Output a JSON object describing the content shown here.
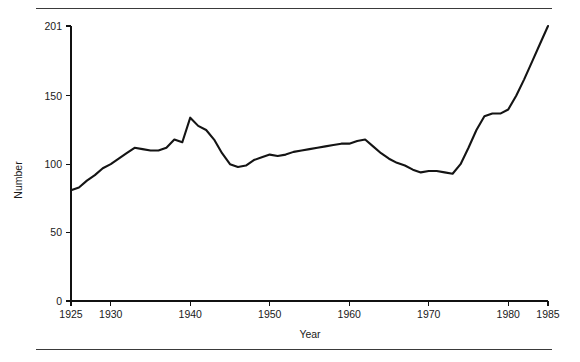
{
  "figure": {
    "background_color": "#ffffff",
    "line_color": "#141414",
    "axis_color": "#111111",
    "rule_color": "#3a3a3a",
    "top_rule": "",
    "bottom_rule": ""
  },
  "chart_data": {
    "type": "line",
    "title": "",
    "xlabel": "Year",
    "ylabel": "Number",
    "xlim": [
      1925,
      1985
    ],
    "ylim": [
      0,
      201
    ],
    "grid": false,
    "legend": null,
    "xticks": [
      1925,
      1930,
      1940,
      1950,
      1960,
      1970,
      1980,
      1985
    ],
    "xtick_labels": [
      "1925",
      "1930",
      "1940",
      "1950",
      "1960",
      "1970",
      "1980",
      "1985"
    ],
    "yticks": [
      0,
      50,
      100,
      150,
      201
    ],
    "ytick_labels": [
      "0",
      "50",
      "100",
      "150",
      "201"
    ],
    "series": [
      {
        "name": "Number",
        "x": [
          1925,
          1926,
          1927,
          1928,
          1929,
          1930,
          1931,
          1932,
          1933,
          1934,
          1935,
          1936,
          1937,
          1938,
          1939,
          1940,
          1941,
          1942,
          1943,
          1944,
          1945,
          1946,
          1947,
          1948,
          1949,
          1950,
          1951,
          1952,
          1953,
          1954,
          1955,
          1956,
          1957,
          1958,
          1959,
          1960,
          1961,
          1962,
          1963,
          1964,
          1965,
          1966,
          1967,
          1968,
          1969,
          1970,
          1971,
          1972,
          1973,
          1974,
          1975,
          1976,
          1977,
          1978,
          1979,
          1980,
          1981,
          1982,
          1983,
          1984,
          1985
        ],
        "y": [
          81,
          83,
          88,
          92,
          97,
          100,
          104,
          108,
          112,
          111,
          110,
          110,
          112,
          118,
          116,
          134,
          128,
          125,
          118,
          108,
          100,
          98,
          99,
          103,
          105,
          107,
          106,
          107,
          109,
          110,
          111,
          112,
          113,
          114,
          115,
          115,
          117,
          118,
          113,
          108,
          104,
          101,
          99,
          96,
          94,
          95,
          95,
          94,
          93,
          100,
          112,
          125,
          135,
          137,
          137,
          140,
          150,
          162,
          175,
          188,
          201
        ]
      }
    ]
  }
}
